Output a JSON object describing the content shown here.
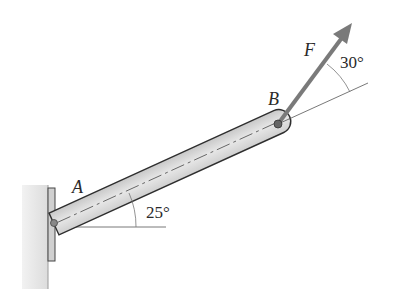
{
  "diagram": {
    "type": "statics-bar-with-force",
    "labels": {
      "point_a": "A",
      "point_b": "B",
      "force": "F",
      "bar_angle": "25°",
      "force_angle": "30°"
    },
    "geometry": {
      "bar_angle_deg": 25,
      "force_angle_from_bar_deg": 30
    },
    "colors": {
      "wall": "#e4e4e4",
      "bar_fill": "#d9d9d9",
      "bar_stroke": "#2e2e2e",
      "force_arrow": "#7a7a7a",
      "lines": "#555555"
    }
  }
}
